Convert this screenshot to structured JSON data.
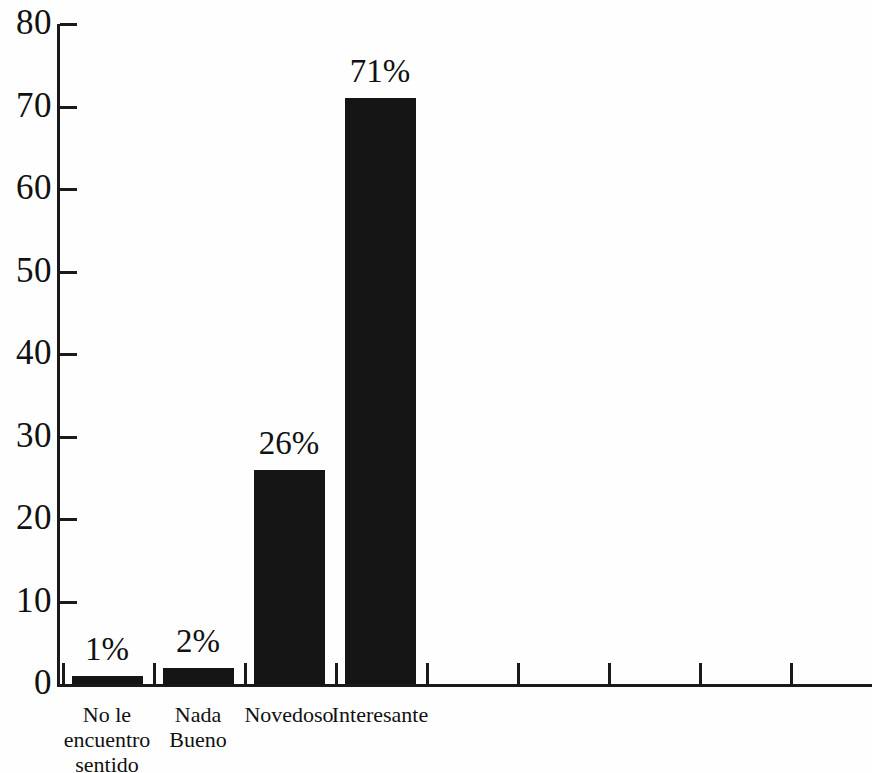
{
  "chart_data": {
    "type": "bar",
    "title": "",
    "subtitle": "",
    "xlabel": "",
    "ylabel": "",
    "ylim": [
      0,
      80
    ],
    "grid": false,
    "legend": false,
    "orientation": "vertical",
    "bar_color": "#151515",
    "axis_color": "#1a1a1a",
    "background_color": "#fefefe",
    "categories": [
      "No le\nencuentro\nsentido",
      "Nada\nBueno",
      "Novedoso",
      "Interesante"
    ],
    "values": [
      1,
      2,
      26,
      71
    ],
    "data_labels": [
      "1%",
      "2%",
      "26%",
      "71%"
    ],
    "y_ticks": [
      0,
      10,
      20,
      30,
      40,
      50,
      60,
      70,
      80
    ],
    "y_tick_labels": [
      "0",
      "10",
      "20",
      "30",
      "40",
      "50",
      "60",
      "70",
      "80"
    ],
    "x_tick_count": 9
  }
}
